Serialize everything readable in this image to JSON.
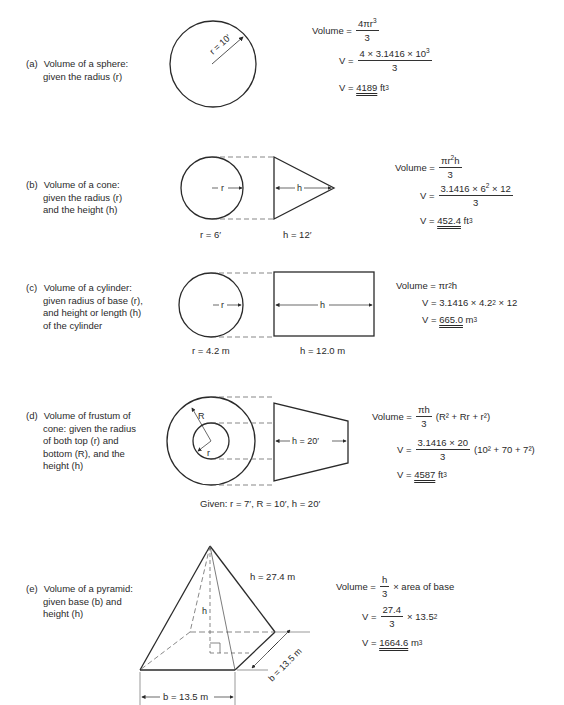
{
  "items": [
    {
      "tag": "(a)",
      "lines": [
        "Volume of a sphere:",
        "given the radius (r)"
      ],
      "figure_labels": {
        "radius": "r = 10′"
      },
      "formula": {
        "general_label": "Volume =",
        "general_num": "4πr",
        "general_num_exp": "3",
        "general_den": "3",
        "sub_label": "V =",
        "sub_num": "4 × 3.1416 × 10",
        "sub_num_exp": "3",
        "sub_den": "3",
        "result_label": "V =",
        "result_value": "4189",
        "result_unit": "ft",
        "result_unit_exp": "3"
      }
    },
    {
      "tag": "(b)",
      "lines": [
        "Volume of a cone:",
        "given the radius (r)",
        "and the height (h)"
      ],
      "figure_labels": {
        "r_arrow": "r",
        "h_arrow": "h",
        "radius": "r = 6′",
        "height": "h = 12′"
      },
      "formula": {
        "general_label": "Volume =",
        "general_num": "πr",
        "general_num_exp": "2",
        "general_num_tail": "h",
        "general_den": "3",
        "sub_label": "V =",
        "sub_num_a": "3.1416 × 6",
        "sub_num_exp": "2",
        "sub_num_b": "× 12",
        "sub_den": "3",
        "result_label": "V =",
        "result_value": "452.4",
        "result_unit": "ft",
        "result_unit_exp": "3"
      }
    },
    {
      "tag": "(c)",
      "lines": [
        "Volume of a cylinder:",
        "given radius of base (r),",
        "and height or length (h)",
        "of the cylinder"
      ],
      "figure_labels": {
        "r_arrow": "r",
        "h_arrow": "h",
        "radius": "r = 4.2 m",
        "height": "h = 12.0 m"
      },
      "formula": {
        "general_label": "Volume =",
        "general_expr": "πr",
        "general_exp": "2",
        "general_tail": "h",
        "sub_label": "V =",
        "sub_a": "3.1416 × 4.2",
        "sub_exp": "2",
        "sub_b": "× 12",
        "result_label": "V =",
        "result_value": "665.0",
        "result_unit": "m",
        "result_unit_exp": "3"
      }
    },
    {
      "tag": "(d)",
      "lines": [
        "Volume of frustum of",
        "cone:  given the radius",
        "of both top (r) and",
        "bottom (R), and the",
        "height (h)"
      ],
      "figure_labels": {
        "R": "R",
        "r": "r",
        "h_arrow": "h = 20′",
        "given": "Given:  r = 7′, R = 10′, h = 20′"
      },
      "formula": {
        "general_label": "Volume =",
        "general_num": "πh",
        "general_den": "3",
        "general_paren": "(R² + Rr + r²)",
        "sub_label": "V =",
        "sub_num": "3.1416 × 20",
        "sub_den": "3",
        "sub_paren": "(10² + 70 + 7²)",
        "result_label": "V =",
        "result_value": "4587",
        "result_unit": "ft",
        "result_unit_exp": "3"
      }
    },
    {
      "tag": "(e)",
      "lines": [
        "Volume of a pyramid:",
        "given base (b) and",
        "height (h)"
      ],
      "figure_labels": {
        "height_text": "h = 27.4 m",
        "h": "h",
        "base_front": "b = 13.5 m",
        "base_side": "b = 13.5 m"
      },
      "formula": {
        "general_label": "Volume =",
        "general_num": "h",
        "general_den": "3",
        "general_tail": "× area of base",
        "sub_label": "V =",
        "sub_num": "27.4",
        "sub_den": "3",
        "sub_tail": "× 13.5",
        "sub_tail_exp": "2",
        "result_label": "V =",
        "result_value": "1664.6",
        "result_unit": "m",
        "result_unit_exp": "3"
      }
    }
  ]
}
